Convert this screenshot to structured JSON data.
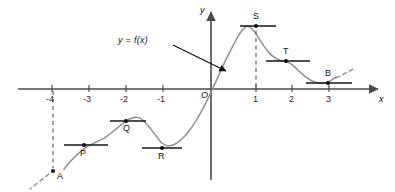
{
  "figure": {
    "curve_label": "y = f(x)",
    "origin_label": "O",
    "x_axis_label": "x",
    "y_axis_label": "y"
  },
  "colors": {
    "axis": "#4a4a4a",
    "curve": "#8a8a8a",
    "tangent": "#1a1a1a",
    "dashed": "#6a6a6a",
    "text": "#111111",
    "background": "#ffffff"
  },
  "chart_data": {
    "type": "line",
    "title": "",
    "xlabel": "x",
    "ylabel": "y",
    "xlim": [
      -4.3,
      3.9
    ],
    "ylim": [
      -2.3,
      1.8
    ],
    "grid": false,
    "legend": null,
    "annotations": [
      {
        "text": "y = f(x)",
        "x": -1.1,
        "y": 1.25,
        "arrow_to_x": 0.45,
        "arrow_to_y": 0.45
      }
    ],
    "x_ticks": [
      {
        "label": "-4",
        "value": -4
      },
      {
        "label": "-3",
        "value": -3
      },
      {
        "label": "-2",
        "value": -2
      },
      {
        "label": "-1",
        "value": -1
      },
      {
        "label": "1",
        "value": 1
      },
      {
        "label": "2",
        "value": 2
      },
      {
        "label": "3",
        "value": 3
      }
    ],
    "y_ticks": [],
    "marked_points": [
      {
        "name": "A",
        "x": -4.0,
        "y": -2.0,
        "kind": "endpoint",
        "tangent": false,
        "dashed_vertical": true,
        "dashed_stub": "lower-left",
        "label_pos": "right"
      },
      {
        "name": "P",
        "x": -3.15,
        "y": -1.33,
        "kind": "inflection",
        "tangent": true,
        "dashed_vertical": false,
        "dashed_stub": null,
        "label_pos": "below"
      },
      {
        "name": "Q",
        "x": -2.05,
        "y": -0.7,
        "kind": "local-maximum",
        "tangent": true,
        "dashed_vertical": false,
        "dashed_stub": null,
        "label_pos": "below"
      },
      {
        "name": "R",
        "x": -1.2,
        "y": -1.41,
        "kind": "local-minimum",
        "tangent": true,
        "dashed_vertical": false,
        "dashed_stub": null,
        "label_pos": "below"
      },
      {
        "name": "S",
        "x": 1.0,
        "y": 1.57,
        "kind": "local-maximum",
        "tangent": true,
        "dashed_vertical": true,
        "dashed_stub": null,
        "label_pos": "above"
      },
      {
        "name": "T",
        "x": 1.95,
        "y": 0.7,
        "kind": "inflection",
        "tangent": true,
        "dashed_vertical": false,
        "dashed_stub": null,
        "label_pos": "above"
      },
      {
        "name": "B",
        "x": 3.0,
        "y": 0.14,
        "kind": "local-minimum",
        "tangent": true,
        "dashed_vertical": false,
        "dashed_stub": "upper-right",
        "label_pos": "above"
      }
    ],
    "curve_points": [
      {
        "x": -4.0,
        "y": -2.0
      },
      {
        "x": -3.8,
        "y": -1.78
      },
      {
        "x": -3.6,
        "y": -1.6
      },
      {
        "x": -3.4,
        "y": -1.45
      },
      {
        "x": -3.15,
        "y": -1.33
      },
      {
        "x": -2.9,
        "y": -1.22
      },
      {
        "x": -2.65,
        "y": -1.05
      },
      {
        "x": -2.4,
        "y": -0.86
      },
      {
        "x": -2.2,
        "y": -0.74
      },
      {
        "x": -2.05,
        "y": -0.7
      },
      {
        "x": -1.9,
        "y": -0.74
      },
      {
        "x": -1.7,
        "y": -0.92
      },
      {
        "x": -1.5,
        "y": -1.16
      },
      {
        "x": -1.35,
        "y": -1.33
      },
      {
        "x": -1.2,
        "y": -1.41
      },
      {
        "x": -1.0,
        "y": -1.38
      },
      {
        "x": -0.8,
        "y": -1.25
      },
      {
        "x": -0.6,
        "y": -1.05
      },
      {
        "x": -0.4,
        "y": -0.78
      },
      {
        "x": -0.2,
        "y": -0.45
      },
      {
        "x": 0.0,
        "y": -0.08
      },
      {
        "x": 0.2,
        "y": 0.32
      },
      {
        "x": 0.4,
        "y": 0.72
      },
      {
        "x": 0.6,
        "y": 1.08
      },
      {
        "x": 0.8,
        "y": 1.4
      },
      {
        "x": 1.0,
        "y": 1.57
      },
      {
        "x": 1.2,
        "y": 1.4
      },
      {
        "x": 1.4,
        "y": 1.12
      },
      {
        "x": 1.6,
        "y": 0.88
      },
      {
        "x": 1.8,
        "y": 0.74
      },
      {
        "x": 1.95,
        "y": 0.7
      },
      {
        "x": 2.15,
        "y": 0.64
      },
      {
        "x": 2.35,
        "y": 0.48
      },
      {
        "x": 2.55,
        "y": 0.32
      },
      {
        "x": 2.75,
        "y": 0.2
      },
      {
        "x": 3.0,
        "y": 0.14
      },
      {
        "x": 3.2,
        "y": 0.18
      },
      {
        "x": 3.4,
        "y": 0.3
      }
    ]
  },
  "tick_labels": {
    "m4": "-4",
    "m3": "-3",
    "m2": "-2",
    "m1": "-1",
    "p1": "1",
    "p2": "2",
    "p3": "3"
  },
  "point_labels": {
    "A": "A",
    "P": "P",
    "Q": "Q",
    "R": "R",
    "S": "S",
    "T": "T",
    "B": "B"
  }
}
